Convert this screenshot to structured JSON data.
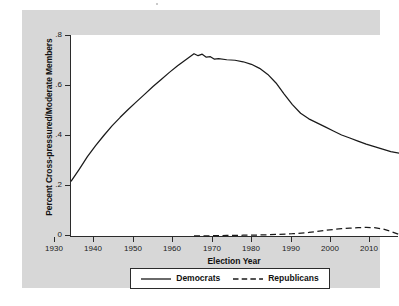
{
  "chart_data": {
    "type": "line",
    "title": "",
    "xlabel": "Election Year",
    "ylabel": "Percent Cross-pressured/Moderate Members",
    "xlim": [
      1930,
      2010
    ],
    "ylim": [
      0,
      0.8
    ],
    "xticks": [
      1930,
      1940,
      1950,
      1960,
      1970,
      1980,
      1990,
      2000,
      2010
    ],
    "xtick_labels": [
      "1930",
      "1940",
      "1950",
      "1960",
      "1970",
      "1980",
      "1990",
      "2000",
      "2010"
    ],
    "yticks": [
      0,
      0.2,
      0.4,
      0.6,
      0.8
    ],
    "ytick_labels": [
      "0",
      ".2",
      ".4",
      ".6",
      ".8"
    ],
    "grid": false,
    "legend_position": "below-axis",
    "series": [
      {
        "name": "Democrats",
        "style": "solid",
        "color": "#1a1a1a",
        "x": [
          1930,
          1932,
          1934,
          1936,
          1938,
          1940,
          1942,
          1944,
          1946,
          1948,
          1950,
          1952,
          1954,
          1956,
          1958,
          1960,
          1961,
          1962,
          1963,
          1964,
          1965,
          1966,
          1968,
          1970,
          1972,
          1974,
          1976,
          1978,
          1980,
          1982,
          1984,
          1986,
          1988,
          1990,
          1992,
          1994,
          1996,
          1998,
          2000,
          2002,
          2004,
          2006,
          2008,
          2010
        ],
        "y": [
          0.22,
          0.268,
          0.318,
          0.362,
          0.402,
          0.44,
          0.474,
          0.506,
          0.536,
          0.566,
          0.596,
          0.624,
          0.652,
          0.678,
          0.702,
          0.726,
          0.718,
          0.724,
          0.712,
          0.714,
          0.704,
          0.706,
          0.702,
          0.7,
          0.694,
          0.684,
          0.668,
          0.644,
          0.61,
          0.566,
          0.524,
          0.49,
          0.468,
          0.452,
          0.436,
          0.42,
          0.404,
          0.392,
          0.38,
          0.368,
          0.358,
          0.348,
          0.338,
          0.332
        ]
      },
      {
        "name": "Republicans",
        "style": "dashed",
        "color": "#1a1a1a",
        "x": [
          1960,
          1964,
          1968,
          1972,
          1976,
          1980,
          1984,
          1988,
          1990,
          1992,
          1994,
          1996,
          1998,
          2000,
          2002,
          2004,
          2006,
          2008,
          2010
        ],
        "y": [
          0.004,
          0.005,
          0.006,
          0.007,
          0.008,
          0.01,
          0.013,
          0.018,
          0.022,
          0.026,
          0.03,
          0.033,
          0.035,
          0.037,
          0.038,
          0.037,
          0.032,
          0.022,
          0.01
        ]
      }
    ]
  },
  "legend": {
    "items": [
      {
        "label": "Democrats",
        "style": "solid"
      },
      {
        "label": "Republicans",
        "style": "dashed"
      }
    ]
  }
}
